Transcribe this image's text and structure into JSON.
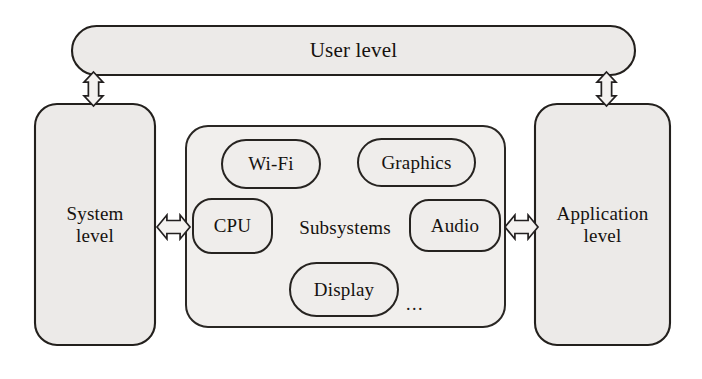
{
  "diagram": {
    "colors": {
      "node_fill": "#eceae8",
      "inner_fill": "#efedeb",
      "stroke": "#23201d",
      "text": "#16120f",
      "arrow_fill": "#f4f2f0",
      "background": "#ffffff"
    },
    "user_level": {
      "label": "User level",
      "shape": "pill",
      "x": 72,
      "y": 26,
      "width": 563,
      "height": 49
    },
    "system_level": {
      "label": "System\nlevel",
      "shape": "rounded-rect",
      "x": 35,
      "y": 104,
      "width": 120,
      "height": 241
    },
    "application_level": {
      "label": "Application\nlevel",
      "shape": "rounded-rect",
      "x": 535,
      "y": 104,
      "width": 135,
      "height": 241
    },
    "subsystems": {
      "label": "Subsystems",
      "shape": "rounded-rect",
      "x": 186,
      "y": 126,
      "width": 319,
      "height": 201,
      "label_x": 290,
      "label_y": 214,
      "label_w": 110,
      "label_h": 28,
      "ellipsis": "...",
      "ellipsis_x": 406,
      "ellipsis_y": 294,
      "items": [
        {
          "label": "Wi-Fi",
          "shape": "pill",
          "x": 222,
          "y": 140,
          "width": 98,
          "height": 48
        },
        {
          "label": "Graphics",
          "shape": "pill",
          "x": 358,
          "y": 139,
          "width": 117,
          "height": 47
        },
        {
          "label": "CPU",
          "shape": "rounded-rect",
          "x": 193,
          "y": 199,
          "width": 79,
          "height": 54
        },
        {
          "label": "Audio",
          "shape": "rounded-rect",
          "x": 410,
          "y": 200,
          "width": 90,
          "height": 51
        },
        {
          "label": "Display",
          "shape": "pill",
          "x": 290,
          "y": 263,
          "width": 108,
          "height": 53
        }
      ]
    },
    "connectors": [
      {
        "name": "user-to-system",
        "orientation": "vertical",
        "x": 84,
        "y": 72,
        "width": 19,
        "height": 34
      },
      {
        "name": "user-to-application",
        "orientation": "vertical",
        "x": 597,
        "y": 72,
        "width": 19,
        "height": 34
      },
      {
        "name": "system-to-subsystems",
        "orientation": "horizontal",
        "x": 157,
        "y": 215,
        "width": 33,
        "height": 24
      },
      {
        "name": "subsystems-to-application",
        "orientation": "horizontal",
        "x": 505,
        "y": 215,
        "width": 33,
        "height": 24
      }
    ]
  }
}
